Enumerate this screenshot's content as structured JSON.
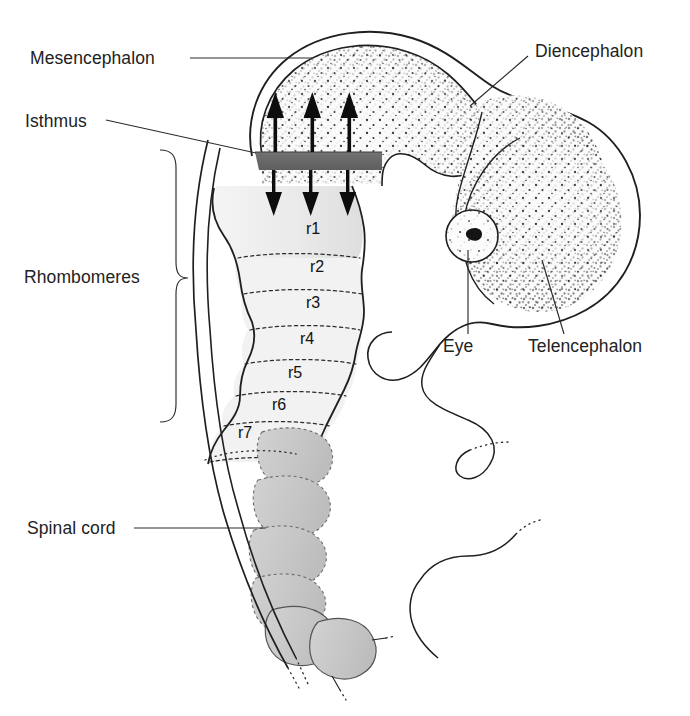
{
  "figure": {
    "background_color": "#ffffff",
    "ink_color": "#1f1f1f"
  },
  "labels": {
    "mesencephalon": "Mesencephalon",
    "isthmus": "Isthmus",
    "rhombomeres": "Rhombomeres",
    "spinal_cord": "Spinal cord",
    "diencephalon": "Diencephalon",
    "telencephalon": "Telencephalon",
    "eye": "Eye"
  },
  "rhombomere_labels": [
    "r1",
    "r2",
    "r3",
    "r4",
    "r5",
    "r6",
    "r7"
  ],
  "structures": {
    "isthmus_band_color": "#6a6a6a",
    "hindbrain_fill": "#e9e9e9",
    "somite_fill": "#c9c9c9",
    "brain_fill": "#f7f7f7",
    "eye_pupil_color": "#1a1a1a"
  },
  "arrows": {
    "up_count": 3,
    "down_count": 3,
    "color": "#0d0d0d",
    "meaning": "signalling from the isthmic organiser"
  }
}
